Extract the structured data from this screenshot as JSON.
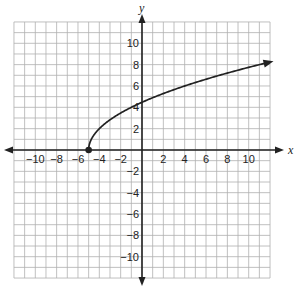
{
  "chart_data": {
    "type": "line",
    "title": "",
    "xlabel": "x",
    "ylabel": "y",
    "xlim": [
      -12,
      12
    ],
    "ylim": [
      -12,
      12
    ],
    "grid": true,
    "grid_step": 1,
    "x_tick_labels": [
      "-10",
      "-8",
      "-6",
      "-4",
      "-2",
      "2",
      "4",
      "6",
      "8",
      "10"
    ],
    "x_ticks": [
      -10,
      -8,
      -6,
      -4,
      -2,
      2,
      4,
      6,
      8,
      10
    ],
    "y_tick_labels": [
      "10",
      "8",
      "6",
      "4",
      "2",
      "-2",
      "-4",
      "-6",
      "-8",
      "-10"
    ],
    "y_ticks": [
      10,
      8,
      6,
      4,
      2,
      -2,
      -4,
      -6,
      -8,
      -10
    ],
    "series": [
      {
        "name": "y = 2√(x + 5)",
        "function": "2*sqrt(x+5)",
        "start_point": {
          "x": -5,
          "y": 0,
          "closed": true
        },
        "end_arrow": true,
        "x": [
          -5,
          -4.5,
          -4,
          -3,
          -2,
          -1,
          0,
          1,
          2,
          3,
          4,
          5,
          6,
          7,
          8,
          9,
          10,
          11,
          12
        ],
        "y": [
          0,
          1.41,
          2,
          2.83,
          3.46,
          4,
          4.47,
          4.9,
          5.29,
          5.66,
          6,
          6.32,
          6.63,
          6.93,
          7.21,
          7.48,
          7.75,
          8,
          8.25
        ]
      }
    ],
    "legend": null
  },
  "colors": {
    "grid": "#b0b0b0",
    "axis": "#222222",
    "curve": "#222222"
  }
}
